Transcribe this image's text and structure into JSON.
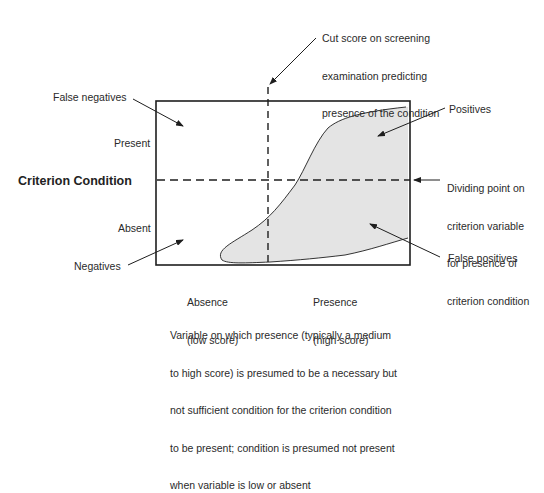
{
  "diagram": {
    "y_axis_title": "Criterion Condition",
    "y_axis_labels": {
      "top": "Present",
      "bottom": "Absent"
    },
    "x_axis_labels": {
      "left": [
        "Absence",
        "(low score)"
      ],
      "right": [
        "Presence",
        "(high score)"
      ]
    },
    "x_axis_caption": [
      "Variable on which presence (typically a medium",
      "to high score) is presumed to be a necessary but",
      "not sufficient condition for the criterion condition",
      "to be present; condition is presumed not present",
      "when variable is low or absent"
    ],
    "annotations": {
      "cut_score": [
        "Cut score on screening",
        "examination predicting",
        "presence of the condition"
      ],
      "dividing_point": [
        "Dividing point on",
        "criterion variable",
        "for presence of",
        "criterion condition"
      ],
      "false_negatives": "False negatives",
      "positives": "Positives",
      "negatives": "Negatives",
      "false_positives": "False positives"
    },
    "colors": {
      "line": "#1e1e1e",
      "shaded_region": "#e4e4e4",
      "background": "#ffffff"
    }
  }
}
